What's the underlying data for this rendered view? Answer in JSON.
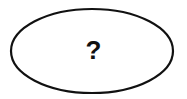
{
  "diagram": {
    "shape": "ellipse",
    "label": "?",
    "stroke_color": "#111111",
    "fill_color": "#ffffff"
  }
}
